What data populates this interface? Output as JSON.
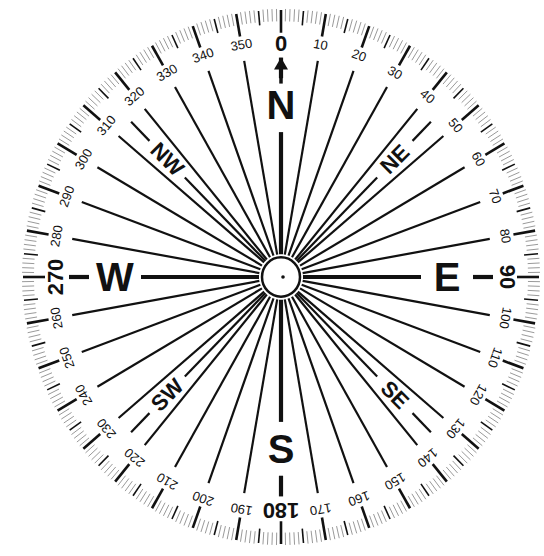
{
  "diagram": {
    "type": "compass-rose",
    "title": "",
    "colors": {
      "ink": "#111111",
      "minor_tick": "#9a9a9a",
      "background": "#ffffff"
    },
    "cardinals": [
      {
        "label": "N",
        "bearing": 0
      },
      {
        "label": "E",
        "bearing": 90
      },
      {
        "label": "S",
        "bearing": 180
      },
      {
        "label": "W",
        "bearing": 270
      }
    ],
    "intercardinals": [
      {
        "label": "NE",
        "bearing": 45
      },
      {
        "label": "SE",
        "bearing": 135
      },
      {
        "label": "SW",
        "bearing": 225
      },
      {
        "label": "NW",
        "bearing": 315
      }
    ],
    "degree_labels": [
      "0",
      "10",
      "20",
      "30",
      "40",
      "50",
      "60",
      "70",
      "80",
      "90",
      "100",
      "110",
      "120",
      "130",
      "140",
      "150",
      "160",
      "170",
      "180",
      "190",
      "200",
      "210",
      "220",
      "230",
      "240",
      "250",
      "260",
      "270",
      "280",
      "290",
      "300",
      "310",
      "320",
      "330",
      "340",
      "350"
    ],
    "major_degree_labels": [
      "0",
      "90",
      "180",
      "270"
    ],
    "tick_intervals": {
      "minor": 1,
      "medium": 5,
      "major": 10
    },
    "radial_line_interval": 10,
    "north_arrow": true,
    "center_hub": true
  }
}
